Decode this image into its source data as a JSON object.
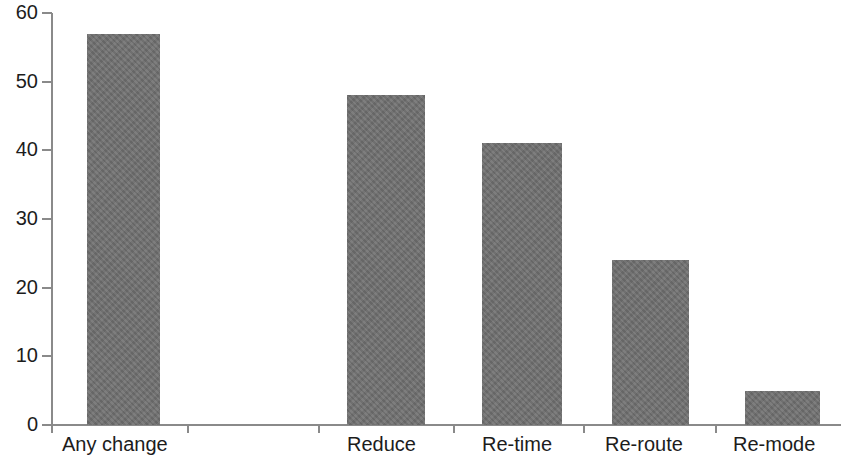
{
  "chart_data": {
    "type": "bar",
    "title": "",
    "subtitle": "",
    "xlabel": "",
    "ylabel": "",
    "categories": [
      "Any change",
      "Reduce",
      "Re-time",
      "Re-route",
      "Re-mode"
    ],
    "values": [
      57,
      48,
      41,
      24,
      5
    ],
    "series": [
      {
        "name": "",
        "values": [
          57,
          48,
          41,
          24,
          5
        ]
      }
    ],
    "ylim": [
      0,
      60
    ],
    "yticks": [
      0,
      10,
      20,
      30,
      40,
      50,
      60
    ],
    "ytick_labels": [
      "0",
      "10",
      "20",
      "30",
      "40",
      "50",
      "60"
    ],
    "grid": false,
    "legend": false,
    "legend_position": "none",
    "bar_color": "#6f6f6f",
    "axis_color": "#8a8a8a",
    "text_color": "#1c1c1c",
    "background_color": "#ffffff"
  }
}
